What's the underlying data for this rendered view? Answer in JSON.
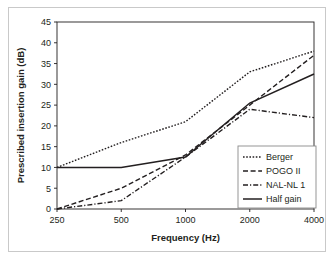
{
  "figure": {
    "background_color": "#ffffff",
    "border_color": "#c9c9c9",
    "ink_color": "#231f20"
  },
  "chart_data": {
    "type": "line",
    "title": "",
    "xlabel": "Frequency (Hz)",
    "ylabel": "Prescribed insertion gain (dB)",
    "x": [
      250,
      500,
      1000,
      2000,
      4000
    ],
    "xtick_labels": [
      "250",
      "500",
      "1000",
      "2000",
      "4000"
    ],
    "x_scale": "log",
    "ylim": [
      0,
      45
    ],
    "yticks": [
      0,
      5,
      10,
      15,
      20,
      25,
      30,
      35,
      40,
      45
    ],
    "ytick_labels": [
      "0",
      "5",
      "10",
      "15",
      "20",
      "25",
      "30",
      "35",
      "40",
      "45"
    ],
    "grid": false,
    "legend_position": "lower right",
    "series": [
      {
        "name": "Berger",
        "style": "dotted",
        "color": "#231f20",
        "values": [
          10,
          16,
          21,
          33,
          38
        ]
      },
      {
        "name": "POGO II",
        "style": "dashed",
        "color": "#231f20",
        "values": [
          0,
          5,
          13,
          25,
          37
        ]
      },
      {
        "name": "NAL-NL 1",
        "style": "dashdot",
        "color": "#231f20",
        "values": [
          0,
          2,
          12.5,
          24,
          22
        ]
      },
      {
        "name": "Half gain",
        "style": "solid",
        "color": "#231f20",
        "values": [
          10,
          10,
          12.5,
          25.5,
          32.5
        ]
      }
    ]
  },
  "legend": {
    "entries": [
      {
        "label": "Berger",
        "style": "dotted"
      },
      {
        "label": "POGO II",
        "style": "dashed"
      },
      {
        "label": "NAL-NL 1",
        "style": "dashdot"
      },
      {
        "label": "Half gain",
        "style": "solid"
      }
    ]
  }
}
